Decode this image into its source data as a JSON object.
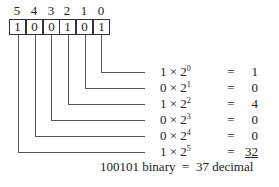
{
  "diagram": {
    "positions": [
      "5",
      "4",
      "3",
      "2",
      "1",
      "0"
    ],
    "bits": [
      "1",
      "0",
      "0",
      "1",
      "0",
      "1"
    ],
    "rows": [
      {
        "bit": "1",
        "times": "×",
        "base": "2",
        "exp": "0",
        "equals": "=",
        "value": "1"
      },
      {
        "bit": "0",
        "times": "×",
        "base": "2",
        "exp": "1",
        "equals": "=",
        "value": "0"
      },
      {
        "bit": "1",
        "times": "×",
        "base": "2",
        "exp": "2",
        "equals": "=",
        "value": "4"
      },
      {
        "bit": "0",
        "times": "×",
        "base": "2",
        "exp": "3",
        "equals": "=",
        "value": "0"
      },
      {
        "bit": "0",
        "times": "×",
        "base": "2",
        "exp": "4",
        "equals": "=",
        "value": "0"
      },
      {
        "bit": "1",
        "times": "×",
        "base": "2",
        "exp": "5",
        "equals": "=",
        "value": "32"
      }
    ],
    "total": {
      "binary": "100101 binary",
      "equals": "=",
      "decimal": "37 decimal"
    }
  }
}
